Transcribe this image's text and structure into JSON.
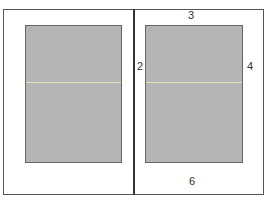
{
  "diagram": {
    "pages": [
      {
        "id": "left-page",
        "fill": "#b4b4b4"
      },
      {
        "id": "right-page",
        "fill": "#b4b4b4"
      }
    ],
    "guide_color": "#e6e2b8",
    "margin_labels": {
      "top": "3",
      "inner": "2",
      "outer": "4",
      "bottom": "6"
    }
  }
}
